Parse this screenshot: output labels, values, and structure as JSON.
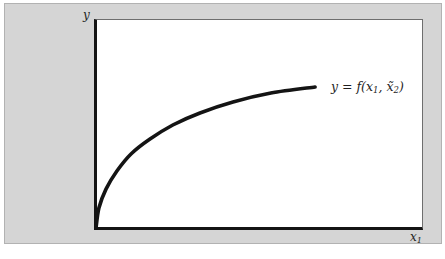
{
  "figure": {
    "panel_bg": "#d5d5d5",
    "panel_border": "#b2b2b2",
    "plot_bg": "#ffffff",
    "axis_color": "#141414",
    "frame_color": "#6e6e6e",
    "curve_color": "#141414",
    "text_color": "#1f1f1f"
  },
  "chart_data": {
    "type": "line",
    "title": "",
    "xlabel": "x₁",
    "ylabel": "y",
    "y_axis_label": "y",
    "x_axis_label": {
      "base": "x",
      "sub": "1"
    },
    "annotation": {
      "text": "y = f(x₁, x̃₂)",
      "p1": "y = f(x",
      "s1": "1",
      "p2": ", x̃",
      "s2": "2",
      "p3": ")"
    },
    "axes_have_ticks": false,
    "axis_ranges_labeled": false,
    "grid": false,
    "legend": "none",
    "series": [
      {
        "name": "y = f(x₁, x̃₂)",
        "description": "concave increasing curve from origin, flattening toward a plateau",
        "points_normalized": [
          [
            0.0,
            0.0
          ],
          [
            0.009,
            0.096
          ],
          [
            0.031,
            0.188
          ],
          [
            0.064,
            0.274
          ],
          [
            0.107,
            0.356
          ],
          [
            0.165,
            0.428
          ],
          [
            0.235,
            0.495
          ],
          [
            0.318,
            0.553
          ],
          [
            0.419,
            0.606
          ],
          [
            0.535,
            0.649
          ],
          [
            0.67,
            0.678
          ]
        ]
      }
    ]
  }
}
